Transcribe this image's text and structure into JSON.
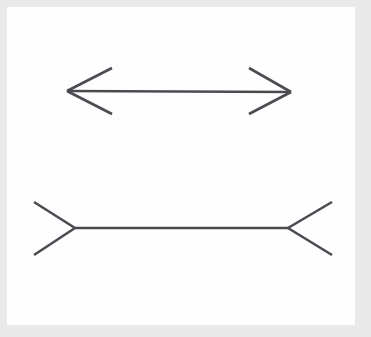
{
  "figure": {
    "width": 371,
    "height": 337
  },
  "colors": {
    "page_background": "#e9e9e9",
    "canvas_background": "#fefefe",
    "stroke": "#4b4b52",
    "stroke_light": "#5a5a61"
  },
  "canvas": {
    "x": 7,
    "y": 7,
    "width": 348,
    "height": 318
  },
  "style": {
    "stroke_width": 2.6,
    "line_cap": "butt",
    "line_join": "miter"
  },
  "chart_data": {
    "type": "line",
    "xlabel": "",
    "ylabel": "",
    "xlim": [
      0,
      371
    ],
    "ylim": [
      337,
      0
    ],
    "grid": false,
    "legend": "none",
    "annotations": [
      "Upper figure: shaft with arrowheads pointing outward (fins angled away from the shaft ends)",
      "Lower figure: shaft with fins pointing inward toward the shaft ends"
    ],
    "series": [
      {
        "name": "top-shaft",
        "points": [
          [
            67,
            91
          ],
          [
            291,
            92
          ]
        ]
      },
      {
        "name": "top-left-arrowhead-upper-barb",
        "points": [
          [
            112,
            68
          ],
          [
            67,
            91
          ]
        ]
      },
      {
        "name": "top-left-arrowhead-lower-barb",
        "points": [
          [
            67,
            91
          ],
          [
            112,
            114
          ]
        ]
      },
      {
        "name": "top-right-arrowhead-upper-barb",
        "points": [
          [
            249,
            68
          ],
          [
            291,
            92
          ]
        ]
      },
      {
        "name": "top-right-arrowhead-lower-barb",
        "points": [
          [
            291,
            92
          ],
          [
            249,
            114
          ]
        ]
      },
      {
        "name": "bottom-shaft",
        "points": [
          [
            75,
            228
          ],
          [
            288,
            228
          ]
        ]
      },
      {
        "name": "bottom-left-fin-upper",
        "points": [
          [
            34,
            202
          ],
          [
            75,
            228
          ]
        ]
      },
      {
        "name": "bottom-left-fin-lower",
        "points": [
          [
            75,
            228
          ],
          [
            34,
            255
          ]
        ]
      },
      {
        "name": "bottom-right-fin-upper",
        "points": [
          [
            288,
            228
          ],
          [
            332,
            202
          ]
        ]
      },
      {
        "name": "bottom-right-fin-lower",
        "points": [
          [
            288,
            228
          ],
          [
            332,
            255
          ]
        ]
      }
    ]
  }
}
